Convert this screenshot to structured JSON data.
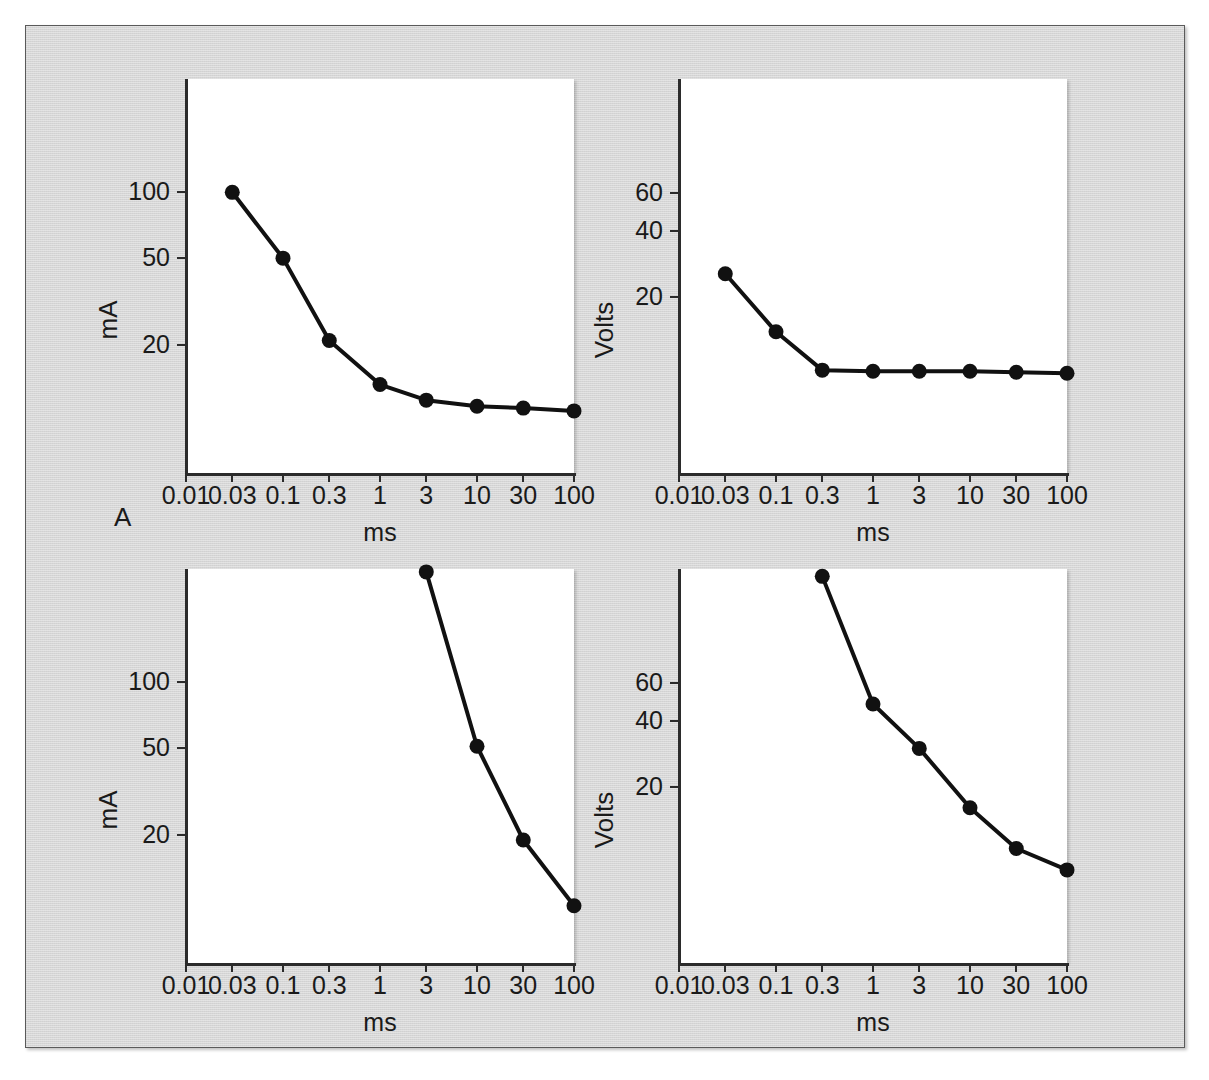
{
  "figure": {
    "background_color": "#d6d6d6",
    "border_color": "#5a5a5a",
    "plot_background": "#ffffff",
    "ink_color": "#1a1a1a"
  },
  "panels": [
    {
      "letter": "A"
    },
    {
      "letter": "B"
    }
  ],
  "axis": {
    "x_title": "ms",
    "x_ticks": [
      "0.01",
      "0.03",
      "0.1",
      "0.3",
      "1",
      "3",
      "10",
      "30",
      "100"
    ],
    "y_title_current": "mA",
    "y_title_voltage": "Volts",
    "y_ticks_current": [
      "100",
      "50",
      "20"
    ],
    "y_ticks_voltage": [
      "60",
      "40",
      "20"
    ]
  },
  "caption": {
    "text": ""
  },
  "chart_data": [
    {
      "id": "A-current",
      "type": "line",
      "panel": "A",
      "title": "",
      "xlabel": "ms",
      "ylabel": "mA",
      "xscale": "log",
      "yscale": "log",
      "xlim": [
        0.01,
        100
      ],
      "ylim": [
        5.2,
        330
      ],
      "xticks": [
        0.01,
        0.03,
        0.1,
        0.3,
        1,
        3,
        10,
        30,
        100
      ],
      "xticklabels": [
        "0.01",
        "0.03",
        "0.1",
        "0.3",
        "1",
        "3",
        "10",
        "30",
        "100"
      ],
      "yticks": [
        100,
        50,
        20
      ],
      "yticklabels": [
        "100",
        "50",
        "20"
      ],
      "grid": false,
      "legend": "none",
      "markers": "filled-circle",
      "x": [
        0.03,
        0.1,
        0.3,
        1,
        3,
        10,
        30,
        100
      ],
      "values": [
        100,
        50,
        21,
        13.2,
        11.2,
        10.5,
        10.3,
        10.0
      ]
    },
    {
      "id": "A-voltage",
      "type": "line",
      "panel": "A",
      "title": "",
      "xlabel": "ms",
      "ylabel": "Volts",
      "xscale": "log",
      "yscale": "log",
      "xlim": [
        0.01,
        100
      ],
      "ylim": [
        3.1,
        200
      ],
      "xticks": [
        0.01,
        0.03,
        0.1,
        0.3,
        1,
        3,
        10,
        30,
        100
      ],
      "xticklabels": [
        "0.01",
        "0.03",
        "0.1",
        "0.3",
        "1",
        "3",
        "10",
        "30",
        "100"
      ],
      "yticks": [
        60,
        40,
        20
      ],
      "yticklabels": [
        "60",
        "40",
        "20"
      ],
      "grid": false,
      "legend": "none",
      "markers": "filled-circle",
      "x": [
        0.03,
        0.1,
        0.3,
        1,
        3,
        10,
        30,
        100
      ],
      "values": [
        25.5,
        13.8,
        9.2,
        9.1,
        9.1,
        9.1,
        9.0,
        8.9
      ]
    },
    {
      "id": "B-current",
      "type": "line",
      "panel": "B",
      "title": "",
      "xlabel": "ms",
      "ylabel": "mA",
      "xscale": "log",
      "yscale": "log",
      "xlim": [
        0.01,
        100
      ],
      "ylim": [
        5.2,
        330
      ],
      "xticks": [
        0.01,
        0.03,
        0.1,
        0.3,
        1,
        3,
        10,
        30,
        100
      ],
      "xticklabels": [
        "0.01",
        "0.03",
        "0.1",
        "0.3",
        "1",
        "3",
        "10",
        "30",
        "100"
      ],
      "yticks": [
        100,
        50,
        20
      ],
      "yticklabels": [
        "100",
        "50",
        "20"
      ],
      "grid": false,
      "legend": "none",
      "markers": "filled-circle",
      "x": [
        3,
        10,
        30,
        100
      ],
      "values": [
        320,
        51,
        19,
        9.5
      ]
    },
    {
      "id": "B-voltage",
      "type": "line",
      "panel": "B",
      "title": "",
      "xlabel": "ms",
      "ylabel": "Volts",
      "xscale": "log",
      "yscale": "log",
      "xlim": [
        0.01,
        100
      ],
      "ylim": [
        3.1,
        200
      ],
      "xticks": [
        0.01,
        0.03,
        0.1,
        0.3,
        1,
        3,
        10,
        30,
        100
      ],
      "xticklabels": [
        "0.01",
        "0.03",
        "0.1",
        "0.3",
        "1",
        "3",
        "10",
        "30",
        "100"
      ],
      "yticks": [
        60,
        40,
        20
      ],
      "yticklabels": [
        "60",
        "40",
        "20"
      ],
      "grid": false,
      "legend": "none",
      "markers": "filled-circle",
      "x": [
        0.3,
        1,
        3,
        10,
        30,
        100
      ],
      "values": [
        185,
        48,
        30,
        16,
        10.4,
        8.3
      ]
    }
  ]
}
